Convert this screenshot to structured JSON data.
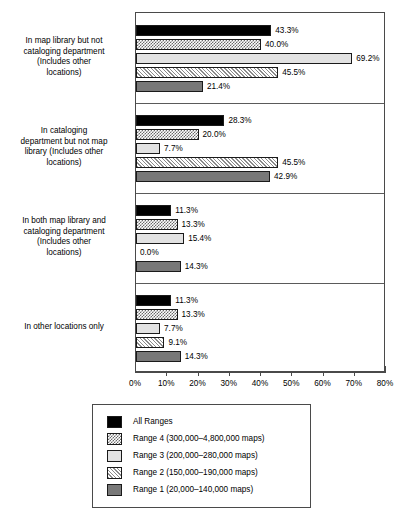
{
  "chart_data": {
    "type": "bar",
    "orientation": "horizontal",
    "title": "",
    "xlabel": "",
    "ylabel": "",
    "xlim": [
      0,
      80
    ],
    "grid": false,
    "legend_position": "bottom",
    "tick_labels": [
      "0%",
      "10%",
      "20%",
      "30%",
      "40%",
      "50%",
      "60%",
      "70%",
      "80%"
    ],
    "tick_values": [
      0,
      10,
      20,
      30,
      40,
      50,
      60,
      70,
      80
    ],
    "categories": [
      "In map library but not cataloging department (Includes other locations)",
      "In cataloging department but not map library (Includes other locations)",
      "In both map library and cataloging department (Includes other locations)",
      "In other locations only"
    ],
    "series": [
      {
        "name": "All Ranges",
        "pattern": "solid-black",
        "values": [
          43.3,
          28.3,
          11.3,
          11.3
        ],
        "labels": [
          "43.3%",
          "28.3%",
          "11.3%",
          "11.3%"
        ]
      },
      {
        "name": "Range 4 (300,000–4,800,000 maps)",
        "pattern": "checker",
        "values": [
          40.0,
          20.0,
          13.3,
          13.3
        ],
        "labels": [
          "40.0%",
          "20.0%",
          "13.3%",
          "13.3%"
        ]
      },
      {
        "name": "Range 3 (200,000–280,000 maps)",
        "pattern": "light-gray",
        "values": [
          69.2,
          7.7,
          15.4,
          7.7
        ],
        "labels": [
          "69.2%",
          "7.7%",
          "15.4%",
          "7.7%"
        ]
      },
      {
        "name": "Range 2 (150,000–190,000 maps)",
        "pattern": "diagonal-hatch",
        "values": [
          45.5,
          45.5,
          0.0,
          9.1
        ],
        "labels": [
          "45.5%",
          "45.5%",
          "0.0%",
          "9.1%"
        ]
      },
      {
        "name": "Range 1 (20,000–140,000 maps)",
        "pattern": "dark-gray",
        "values": [
          21.4,
          42.9,
          14.3,
          14.3
        ],
        "labels": [
          "21.4%",
          "42.9%",
          "14.3%",
          "14.3%"
        ]
      }
    ]
  },
  "categories": [
    {
      "lines": [
        "In map library but not",
        "cataloging department",
        "(Includes other",
        "locations)"
      ]
    },
    {
      "lines": [
        "In cataloging",
        "department but not map",
        "library (Includes other",
        "locations)"
      ]
    },
    {
      "lines": [
        "In both map library and",
        "cataloging department",
        "(Includes other",
        "locations)"
      ]
    },
    {
      "lines": [
        "In other locations only"
      ]
    }
  ],
  "axis": {
    "ticks": [
      "0%",
      "10%",
      "20%",
      "30%",
      "40%",
      "50%",
      "60%",
      "70%",
      "80%"
    ]
  },
  "legend": {
    "items": [
      {
        "label": "All Ranges",
        "pattern": "solid-black"
      },
      {
        "label": "Range 4 (300,000–4,800,000 maps)",
        "pattern": "checker"
      },
      {
        "label": "Range 3 (200,000–280,000 maps)",
        "pattern": "light-gray"
      },
      {
        "label": "Range 2 (150,000–190,000 maps)",
        "pattern": "diagonal-hatch"
      },
      {
        "label": "Range 1 (20,000–140,000 maps)",
        "pattern": "dark-gray"
      }
    ]
  },
  "colors": {
    "axis": "#4a4a4a",
    "solid_black": "#000000",
    "light_gray": "#e2e2e2",
    "dark_gray": "#787878",
    "hatch": "#8c8c8c"
  }
}
